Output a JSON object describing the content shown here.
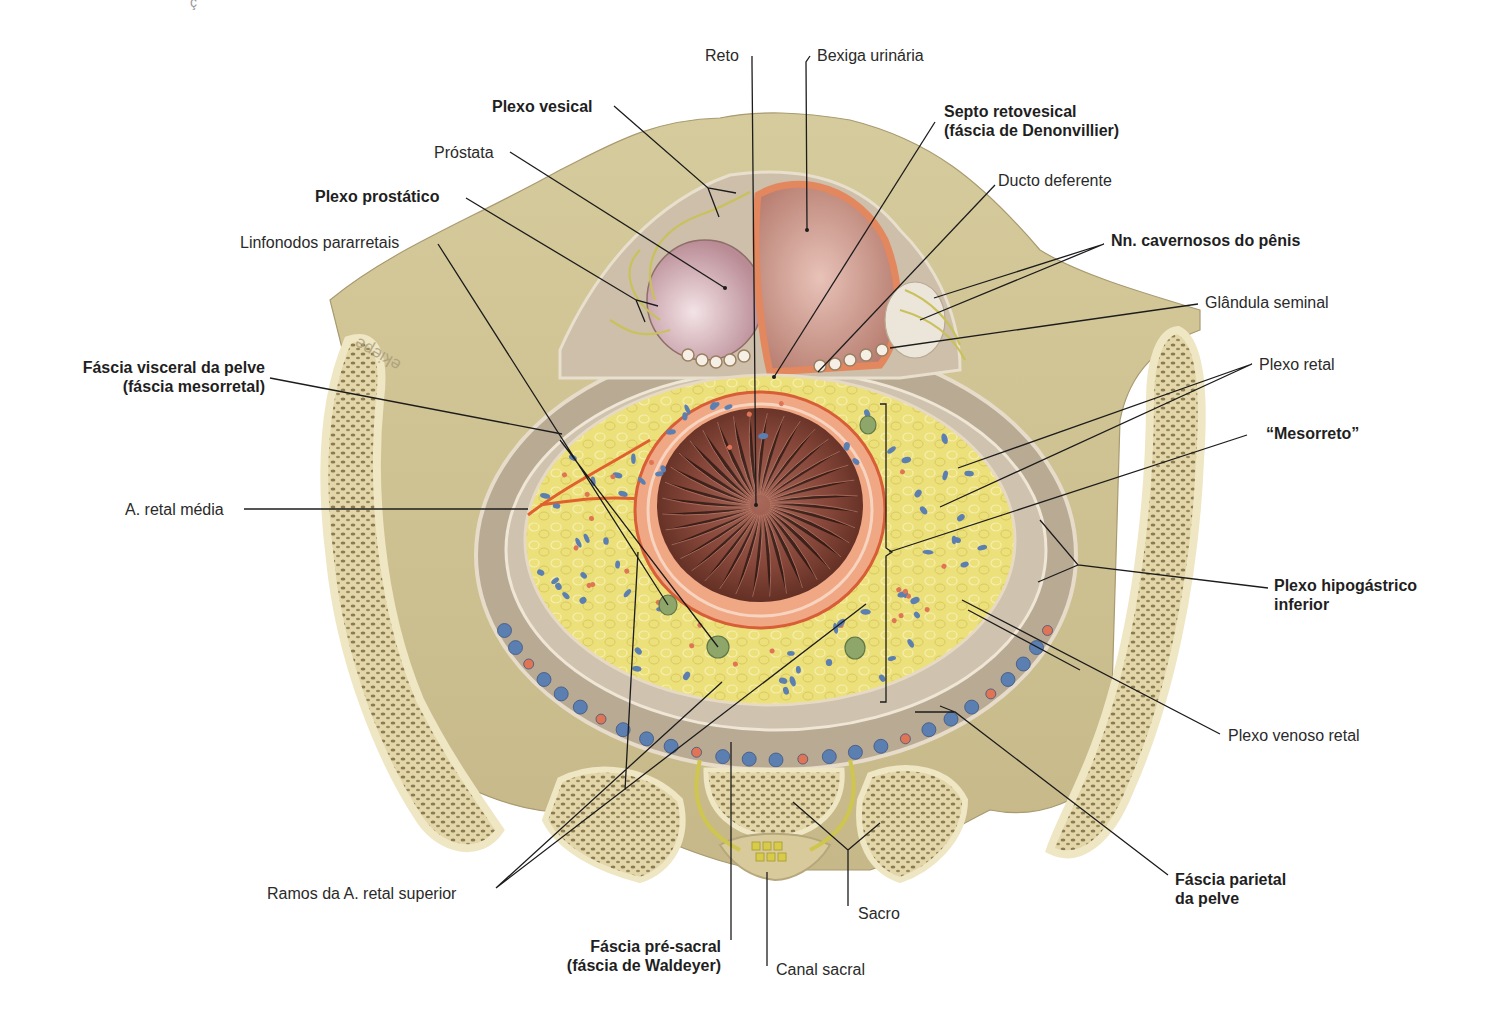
{
  "figure": {
    "corner_fragment": "ç",
    "watermark": "ekiepe",
    "colors": {
      "bone": "#d9cfa6",
      "bone_cortex": "#ece3bd",
      "trabecular": "#8a7a55",
      "fascia": "#bcae95",
      "mesorectal_fat": "#ecdf6e",
      "rectum_lumen": "#7a3e2c",
      "rectal_wall": "#e58a60",
      "bladder": "#c79083",
      "prostate": "#cfa5ad",
      "vein": "#5c7fb2",
      "artery": "#e07556",
      "nerve": "#c8c25a",
      "lymph_node": "#7f9a62",
      "leader_line": "#1c1c1c"
    }
  },
  "labels": {
    "reto": "Reto",
    "bexiga": "Bexiga urinária",
    "plexo_vesical": "Plexo vesical",
    "prostata": "Próstata",
    "plexo_prostatico": "Plexo prostático",
    "linfonodos": "Linfonodos pararretais",
    "septo": [
      "Septo retovesical",
      "(fáscia de Denonvillier)"
    ],
    "ducto": "Ducto deferente",
    "nn_cavernosos": "Nn. cavernosos do pênis",
    "glandula": "Glândula seminal",
    "plexo_retal": "Plexo retal",
    "mesorreto": "“Mesorreto”",
    "fascia_visceral": [
      "Fáscia visceral da pelve",
      "(fáscia mesorretal)"
    ],
    "a_retal_media": "A. retal média",
    "plexo_hipogastrico": [
      "Plexo hipogástrico",
      "inferior"
    ],
    "plexo_venoso": "Plexo venoso retal",
    "fascia_parietal": [
      "Fáscia parietal",
      "da pelve"
    ],
    "ramos": "Ramos da A. retal superior",
    "sacro": "Sacro",
    "fascia_presacral": [
      "Fáscia pré-sacral",
      "(fáscia de Waldeyer)"
    ],
    "canal_sacral": "Canal sacral"
  }
}
